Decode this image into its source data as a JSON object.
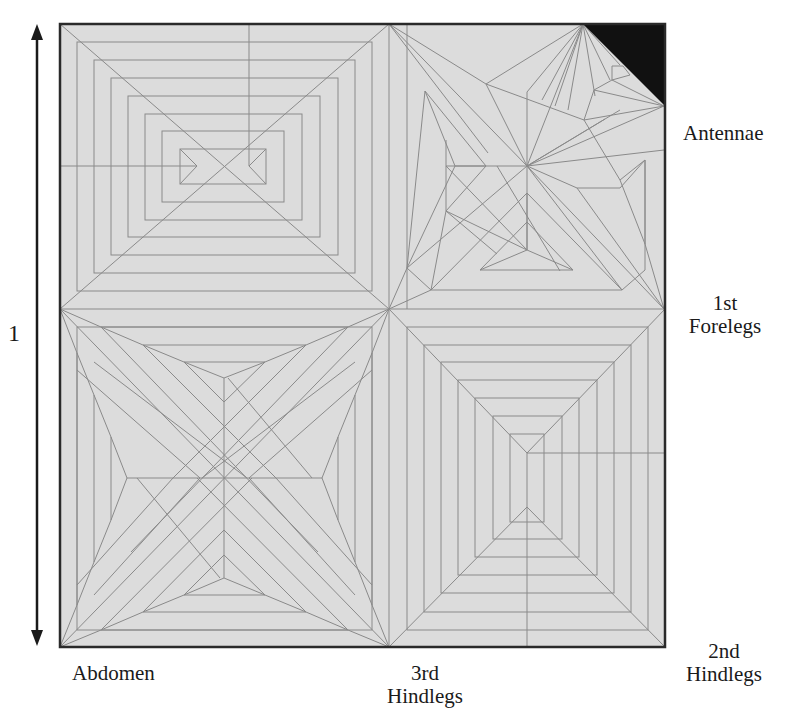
{
  "figure": {
    "type": "origami-crease-pattern",
    "paper_fill": "#dcdcdc",
    "crease_color": "#8a8a8a",
    "border_color": "#2a2a2a",
    "cut_corner_color": "#111111"
  },
  "dimension": {
    "label": "1",
    "arrow": "double-headed-vertical"
  },
  "labels": {
    "antennae": "Antennae",
    "first_forelegs_line1": "1st",
    "first_forelegs_line2": "Forelegs",
    "second_hindlegs_line1": "2nd",
    "second_hindlegs_line2": "Hindlegs",
    "third_hindlegs_line1": "3rd",
    "third_hindlegs_line2": "Hindlegs",
    "abdomen": "Abdomen"
  }
}
